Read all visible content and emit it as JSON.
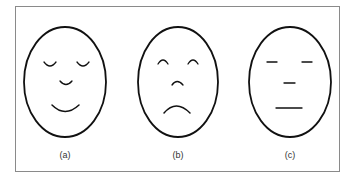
{
  "figure": {
    "panels": [
      {
        "label": "(a)",
        "expression": "happy",
        "icon": "smiling-face-icon"
      },
      {
        "label": "(b)",
        "expression": "sad",
        "icon": "frowning-face-icon"
      },
      {
        "label": "(c)",
        "expression": "neutral",
        "icon": "neutral-face-icon"
      }
    ],
    "colors": {
      "stroke": "#111111",
      "frame": "#8a8a8a",
      "background": "#ffffff"
    }
  }
}
